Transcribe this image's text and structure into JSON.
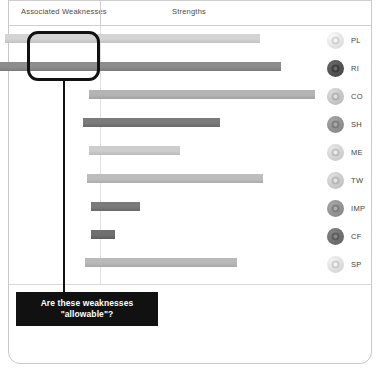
{
  "frame": {
    "present": true
  },
  "header": {
    "weaknesses_label": "Associated Weaknesses",
    "strengths_label": "Strengths"
  },
  "callout": {
    "text": "Are these weaknesses\n\"allowable\"?",
    "background": "#111111",
    "text_color": "#ffffff",
    "highlight_border_color": "#111111"
  },
  "colors": {
    "axis": "#e0e0e0",
    "rule": "#cfcfcf",
    "bar_light": "#d2d2d2",
    "bar_medium": "#b0b0b0",
    "bar_dark": "#8a8a8a",
    "bar_darkest": "#6f6f6f"
  },
  "chart_data": {
    "type": "bar",
    "title": "",
    "subtitle": "",
    "xlabel": "",
    "ylabel": "",
    "orientation": "horizontal",
    "diverging": true,
    "axis_zero_label": "0",
    "columns": [
      "Associated Weaknesses",
      "Strengths"
    ],
    "legend_position": "right",
    "grid": false,
    "xlim": [
      -100,
      100
    ],
    "categories": [
      "PL",
      "RI",
      "CO",
      "SH",
      "ME",
      "TW",
      "IMP",
      "CF",
      "SP"
    ],
    "series": [
      {
        "name": "Associated Weaknesses",
        "values": [
          -50,
          -68,
          -6,
          -9,
          -6,
          -7,
          -5,
          -5,
          -8
        ]
      },
      {
        "name": "Strengths",
        "values": [
          84,
          95,
          113,
          63,
          42,
          86,
          21,
          8,
          72
        ]
      }
    ],
    "bars": [
      {
        "code": "PL",
        "label": "PL",
        "weakness_extent": -50,
        "strength_extent": 84,
        "shade": "bar_light",
        "color": "#d4d4d4"
      },
      {
        "code": "RI",
        "label": "RI",
        "weakness_extent": -68,
        "strength_extent": 95,
        "shade": "bar_dark",
        "color": "#8d8d8d"
      },
      {
        "code": "CO",
        "label": "CO",
        "weakness_extent": -6,
        "strength_extent": 113,
        "shade": "bar_medium",
        "color": "#b4b4b4"
      },
      {
        "code": "SH",
        "label": "SH",
        "weakness_extent": -9,
        "strength_extent": 63,
        "shade": "bar_darkest",
        "color": "#7b7b7b"
      },
      {
        "code": "ME",
        "label": "ME",
        "weakness_extent": -6,
        "strength_extent": 42,
        "shade": "bar_light",
        "color": "#cdcdcd"
      },
      {
        "code": "TW",
        "label": "TW",
        "weakness_extent": -7,
        "strength_extent": 86,
        "shade": "bar_medium",
        "color": "#bdbdbd"
      },
      {
        "code": "IMP",
        "label": "IMP",
        "weakness_extent": -5,
        "strength_extent": 21,
        "shade": "bar_darkest",
        "color": "#7a7a7a"
      },
      {
        "code": "CF",
        "label": "CF",
        "weakness_extent": -5,
        "strength_extent": 8,
        "shade": "bar_darkest",
        "color": "#6f6f6f"
      },
      {
        "code": "SP",
        "label": "SP",
        "weakness_extent": -8,
        "strength_extent": 72,
        "shade": "bar_medium",
        "color": "#b9b9b9"
      }
    ]
  },
  "legend": {
    "items": [
      {
        "label": "PL",
        "icon": "gear-icon",
        "icon_tone": "#e2e2e2"
      },
      {
        "label": "RI",
        "icon": "note-icon",
        "icon_tone": "#4f4f4f"
      },
      {
        "label": "CO",
        "icon": "person-icon",
        "icon_tone": "#c3c3c3"
      },
      {
        "label": "SH",
        "icon": "sphere-icon",
        "icon_tone": "#8e8e8e"
      },
      {
        "label": "ME",
        "icon": "target-icon",
        "icon_tone": "#d0d0d0"
      },
      {
        "label": "TW",
        "icon": "people-icon",
        "icon_tone": "#c8c8c8"
      },
      {
        "label": "IMP",
        "icon": "puzzle-icon",
        "icon_tone": "#8f8f8f"
      },
      {
        "label": "CF",
        "icon": "globe-icon",
        "icon_tone": "#6d6d6d"
      },
      {
        "label": "SP",
        "icon": "spiral-icon",
        "icon_tone": "#dcdcdc"
      }
    ]
  }
}
